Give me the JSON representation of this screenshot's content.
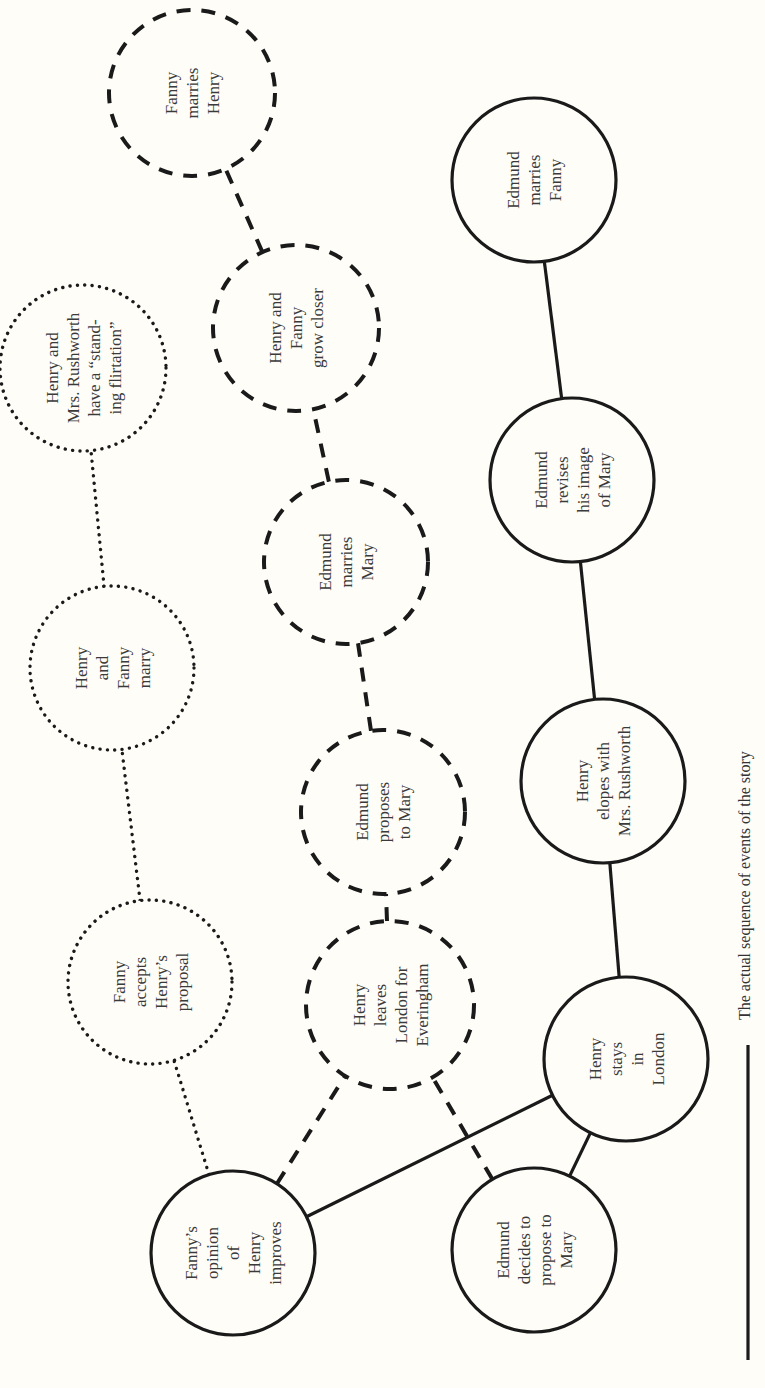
{
  "diagram": {
    "orientation": "rotated-90-ccw",
    "background_color": "#fefdf8",
    "line_color": "#1a1a1a",
    "legend": {
      "solid_line_label": "The actual sequence of events of the story"
    },
    "nodes": [
      {
        "id": "fanny_opinion",
        "style": "solid",
        "lines": [
          "Fanny’s",
          "opinion",
          "of",
          "Henry",
          "improves"
        ],
        "cx": 233,
        "cy": 1253,
        "r": 82
      },
      {
        "id": "henry_stays",
        "style": "solid",
        "lines": [
          "Henry",
          "stays",
          "in",
          "London"
        ],
        "cx": 626,
        "cy": 1059,
        "r": 82
      },
      {
        "id": "edmund_decides",
        "style": "solid",
        "lines": [
          "Edmund",
          "decides to",
          "propose to",
          "Mary"
        ],
        "cx": 534,
        "cy": 1250,
        "r": 82
      },
      {
        "id": "henry_elopes",
        "style": "solid",
        "lines": [
          "Henry",
          "elopes with",
          "Mrs. Rushworth"
        ],
        "cx": 603,
        "cy": 781,
        "r": 82
      },
      {
        "id": "edmund_revises",
        "style": "solid",
        "lines": [
          "Edmund",
          "revises",
          "his image",
          "of Mary"
        ],
        "cx": 572,
        "cy": 480,
        "r": 82
      },
      {
        "id": "edmund_marries_fanny",
        "style": "solid",
        "lines": [
          "Edmund",
          "marries",
          "Fanny"
        ],
        "cx": 534,
        "cy": 180,
        "r": 82
      },
      {
        "id": "henry_leaves",
        "style": "dashed",
        "lines": [
          "Henry",
          "leaves",
          "London for",
          "Everingham"
        ],
        "cx": 390,
        "cy": 1005,
        "r": 84
      },
      {
        "id": "edmund_proposes",
        "style": "dashed",
        "lines": [
          "Edmund",
          "proposes",
          "to Mary"
        ],
        "cx": 383,
        "cy": 812,
        "r": 82
      },
      {
        "id": "edmund_marries_mary",
        "style": "dashed",
        "lines": [
          "Edmund",
          "marries",
          "Mary"
        ],
        "cx": 346,
        "cy": 562,
        "r": 82
      },
      {
        "id": "henry_fanny_closer",
        "style": "dashed",
        "lines": [
          "Henry and",
          "Fanny",
          "grow closer"
        ],
        "cx": 296,
        "cy": 328,
        "r": 83
      },
      {
        "id": "fanny_marries_henry",
        "style": "dashed",
        "lines": [
          "Fanny",
          "marries",
          "Henry"
        ],
        "cx": 192,
        "cy": 93,
        "r": 83
      },
      {
        "id": "fanny_accepts",
        "style": "dotted",
        "lines": [
          "Fanny",
          "accepts",
          "Henry’s",
          "proposal"
        ],
        "cx": 150,
        "cy": 982,
        "r": 82
      },
      {
        "id": "henry_fanny_marry",
        "style": "dotted",
        "lines": [
          "Henry",
          "and",
          "Fanny",
          "marry"
        ],
        "cx": 112,
        "cy": 668,
        "r": 82
      },
      {
        "id": "henry_rushworth_flirt",
        "style": "dotted",
        "lines": [
          "Henry and",
          "Mrs. Rushworth",
          "have a “stand-",
          "ing flirtation”"
        ],
        "cx": 83,
        "cy": 368,
        "r": 83
      }
    ],
    "edges": [
      {
        "from": "fanny_opinion",
        "to": "henry_stays",
        "style": "solid"
      },
      {
        "from": "henry_stays",
        "to": "edmund_decides",
        "style": "solid"
      },
      {
        "from": "henry_stays",
        "to": "henry_elopes",
        "style": "solid"
      },
      {
        "from": "henry_elopes",
        "to": "edmund_revises",
        "style": "solid"
      },
      {
        "from": "edmund_revises",
        "to": "edmund_marries_fanny",
        "style": "solid"
      },
      {
        "from": "fanny_opinion",
        "to": "henry_leaves",
        "style": "dashed"
      },
      {
        "from": "edmund_decides",
        "to": "henry_leaves",
        "style": "dashed"
      },
      {
        "from": "henry_leaves",
        "to": "edmund_proposes",
        "style": "dashed"
      },
      {
        "from": "edmund_proposes",
        "to": "edmund_marries_mary",
        "style": "dashed"
      },
      {
        "from": "edmund_marries_mary",
        "to": "henry_fanny_closer",
        "style": "dashed"
      },
      {
        "from": "henry_fanny_closer",
        "to": "fanny_marries_henry",
        "style": "dashed"
      },
      {
        "from": "fanny_opinion",
        "to": "fanny_accepts",
        "style": "dotted"
      },
      {
        "from": "fanny_accepts",
        "to": "henry_fanny_marry",
        "style": "dotted"
      },
      {
        "from": "henry_fanny_marry",
        "to": "henry_rushworth_flirt",
        "style": "dotted"
      }
    ]
  }
}
